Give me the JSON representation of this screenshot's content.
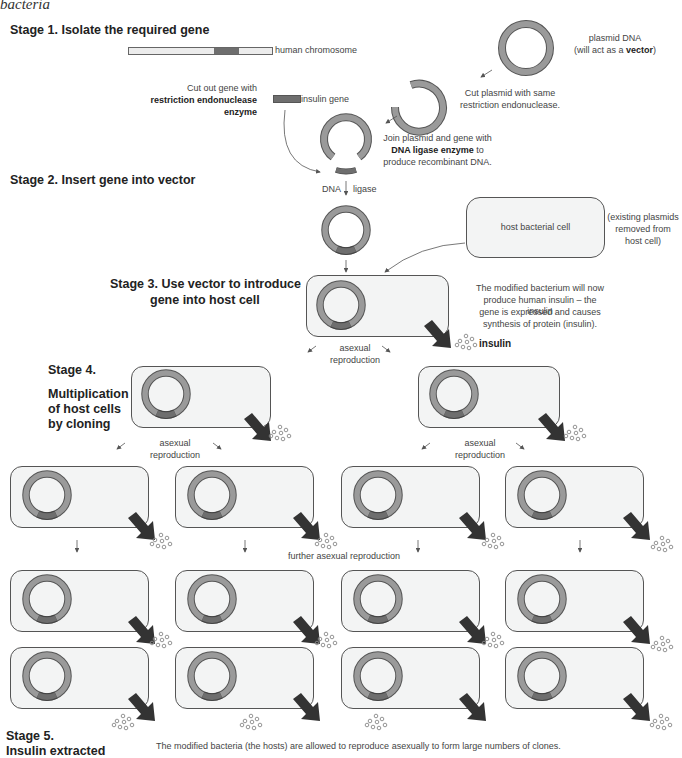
{
  "caption": "bacteria",
  "stages": {
    "s1": "Stage 1. Isolate the required gene",
    "s2": "Stage 2. Insert gene into vector",
    "s3_line1": "Stage 3. Use vector to introduce",
    "s3_line2": "gene into host cell",
    "s4_title": "Stage 4.",
    "s4_line1": "Multiplication",
    "s4_line2": "of host cells",
    "s4_line3": "by cloning",
    "s5_line1": "Stage 5.",
    "s5_line2": "Insulin extracted"
  },
  "labels": {
    "human_chromosome": "human chromosome",
    "cut_gene_1": "Cut out gene with",
    "cut_gene_2": "restriction endonuclease",
    "cut_gene_3": "enzyme",
    "insulin_gene": "insulin gene",
    "plasmid_1": "plasmid DNA",
    "plasmid_2a": "(will act as a ",
    "plasmid_2b": "vector",
    "plasmid_2c": ")",
    "cut_plasmid_1": "Cut plasmid with same",
    "cut_plasmid_2": "restriction endonuclease.",
    "join_1": "Join plasmid and gene with",
    "join_2a": "DNA ligase enzyme",
    "join_2b": " to",
    "join_3": "produce recombinant DNA.",
    "dna": "DNA",
    "ligase": "ligase",
    "host_cell": "host bacterial cell",
    "existing_1": "(existing plasmids",
    "existing_2": "removed from",
    "existing_3": "host cell)",
    "modified_1": "The modified bacterium will now",
    "modified_2": "produce human insulin – the insulin",
    "modified_3": "gene is expressed and causes",
    "modified_4": "synthesis of protein (insulin).",
    "insulin": "insulin",
    "asexual": "asexual",
    "reproduction": "reproduction",
    "further": "further asexual reproduction",
    "footer": "The modified bacteria (the hosts) are allowed to reproduce asexually to form large numbers of clones."
  },
  "colors": {
    "plasmid_ring": "#9a9a9a",
    "gene": "#6e6e6e",
    "cell_fill": "#f3f4f4",
    "arrow_dark": "#333333"
  }
}
